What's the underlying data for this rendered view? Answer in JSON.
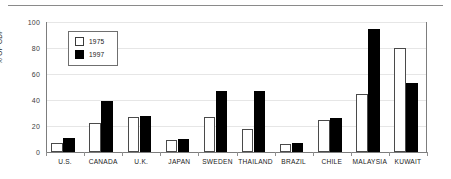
{
  "chart_data": {
    "type": "bar",
    "title": "",
    "subtitle": "",
    "xlabel": "",
    "ylabel": "% OF GDP",
    "ylim": [
      0,
      100
    ],
    "yticks": [
      0,
      20,
      40,
      60,
      80,
      100
    ],
    "grid": "horizontal",
    "legend_position": "upper-left-inside",
    "categories": [
      "U.S.",
      "CANADA",
      "U.K.",
      "JAPAN",
      "SWEDEN",
      "THAILAND",
      "BRAZIL",
      "CHILE",
      "MALAYSIA",
      "KUWAIT"
    ],
    "series": [
      {
        "name": "1975",
        "color": "#ffffff",
        "edge_color": "#4a4a4a",
        "values": [
          7,
          22,
          27,
          9,
          27,
          18,
          6,
          25,
          45,
          80
        ]
      },
      {
        "name": "1997",
        "color": "#000000",
        "edge_color": "#000000",
        "values": [
          11,
          39,
          28,
          10,
          47,
          47,
          7,
          26,
          95,
          53
        ]
      }
    ]
  },
  "legend": {
    "entries": [
      {
        "label": "1975",
        "swatch": "hollow-square-icon"
      },
      {
        "label": "1997",
        "swatch": "filled-square-icon"
      }
    ]
  },
  "colors": {
    "axis": "#7d7d7d",
    "grid": "#e6e6e6",
    "rule": "#8a8a8a",
    "text": "#1a1a1a",
    "background": "#ffffff"
  }
}
